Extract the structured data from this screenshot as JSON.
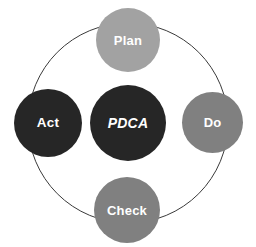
{
  "diagram": {
    "type": "cycle",
    "background_color": "#ffffff",
    "ring": {
      "name": "cycle-ring",
      "stroke_color": "#3a3a3a",
      "stroke_width": 1,
      "center_x": 128,
      "center_y": 123,
      "radius": 100
    },
    "center_node": {
      "label": "PDCA",
      "fill_color": "#262626",
      "text_color": "#ffffff",
      "italic": true
    },
    "nodes": [
      {
        "id": "plan",
        "label": "Plan",
        "position": "top",
        "fill_color": "#a2a2a2",
        "text_color": "#ffffff"
      },
      {
        "id": "do",
        "label": "Do",
        "position": "right",
        "fill_color": "#808080",
        "text_color": "#ffffff"
      },
      {
        "id": "check",
        "label": "Check",
        "position": "bottom",
        "fill_color": "#808080",
        "text_color": "#ffffff"
      },
      {
        "id": "act",
        "label": "Act",
        "position": "left",
        "fill_color": "#262626",
        "text_color": "#ffffff"
      }
    ]
  }
}
